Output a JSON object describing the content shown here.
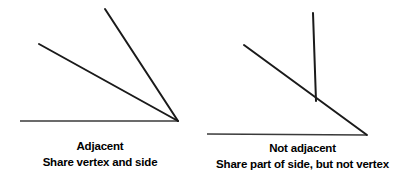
{
  "canvas": {
    "width": 410,
    "height": 187,
    "background_color": "#ffffff"
  },
  "style": {
    "baseline_color": "#3a3a3a",
    "ray_color": "#1a1a1a",
    "text_color": "#000000",
    "baseline_width": 1.6,
    "ray_width": 2.0
  },
  "figures": [
    {
      "id": "adjacent",
      "caption_title": "Adjacent",
      "caption_sub": "Share vertex and side",
      "vertex": {
        "x": 178,
        "y": 121
      },
      "segments": [
        {
          "name": "baseline-ray",
          "x1": 20,
          "y1": 121,
          "x2": 178,
          "y2": 121,
          "kind": "baseline"
        },
        {
          "name": "shallow-ray",
          "x1": 39,
          "y1": 44,
          "x2": 178,
          "y2": 121,
          "kind": "ray"
        },
        {
          "name": "steep-ray",
          "x1": 105,
          "y1": 9,
          "x2": 178,
          "y2": 121,
          "kind": "ray"
        }
      ]
    },
    {
      "id": "not-adjacent",
      "caption_title": "Not adjacent",
      "caption_sub": "Share part of side, but not vertex",
      "vertex": {
        "x": 367,
        "y": 135
      },
      "intersection": {
        "x": 316,
        "y": 101
      },
      "segments": [
        {
          "name": "baseline-ray",
          "x1": 207,
          "y1": 134,
          "x2": 367,
          "y2": 135,
          "kind": "baseline"
        },
        {
          "name": "diagonal-ray",
          "x1": 244,
          "y1": 45,
          "x2": 367,
          "y2": 135,
          "kind": "ray"
        },
        {
          "name": "vertical-ray",
          "x1": 313,
          "y1": 13,
          "x2": 316,
          "y2": 101,
          "kind": "ray"
        }
      ]
    }
  ]
}
